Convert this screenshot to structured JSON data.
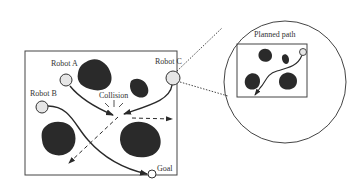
{
  "diagram": {
    "type": "multi-robot path planning illustration",
    "labels": {
      "robot_a": "Robot A",
      "robot_b": "Robot B",
      "robot_c": "Robot C",
      "collision": "Collision",
      "goal": "Goal",
      "planned_path": "Planned path"
    },
    "colors": {
      "obstacle": "#2a2a2a",
      "robot_fill": "#e6e6e6",
      "stroke": "#333333",
      "background": "#ffffff"
    },
    "elements": {
      "main_workspace": "Workspace with four obstacles, three robots and a goal",
      "zoom_inset": "Ellipse callout showing the planned path for Robot C",
      "dashed_arrows": [
        "Robot C deflected direction",
        "Robot A deflected direction"
      ]
    }
  }
}
